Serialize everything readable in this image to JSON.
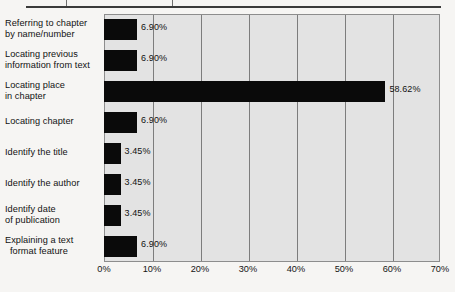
{
  "document": {
    "top_rule_ghost_left": "",
    "top_rule_ghost_right": ""
  },
  "chart_data": {
    "type": "bar",
    "orientation": "horizontal",
    "title": "",
    "xlabel": "",
    "ylabel": "",
    "xlim": [
      0,
      70
    ],
    "xtick_labels": [
      "0%",
      "10%",
      "20%",
      "30%",
      "40%",
      "50%",
      "60%",
      "70%"
    ],
    "xtick_values": [
      0,
      10,
      20,
      30,
      40,
      50,
      60,
      70
    ],
    "grid": true,
    "legend": false,
    "bar_color": "#0a0a0a",
    "plot_background": "#e3e3e3",
    "gridline_color": "#7d7d7d",
    "categories": [
      "Referring to chapter by name/number",
      "Locating previous information from text",
      "Locating place in chapter",
      "Locating chapter",
      "Identify the title",
      "Identify the author",
      "Identify date of publication",
      "Explaining a text format feature"
    ],
    "category_lines": [
      [
        "Referring to chapter",
        "by name/number"
      ],
      [
        "Locating previous",
        "information from text"
      ],
      [
        "Locating place",
        "in chapter"
      ],
      [
        "Locating chapter"
      ],
      [
        "Identify the title"
      ],
      [
        "Identify the author"
      ],
      [
        "Identify date",
        "of publication"
      ],
      [
        "Explaining a text",
        "format feature"
      ]
    ],
    "values": [
      6.9,
      6.9,
      58.62,
      6.9,
      3.45,
      3.45,
      3.45,
      6.9
    ],
    "value_labels": [
      "6.90%",
      "6.90%",
      "58.62%",
      "6.90%",
      "3.45%",
      "3.45%",
      "3.45%",
      "6.90%"
    ]
  }
}
